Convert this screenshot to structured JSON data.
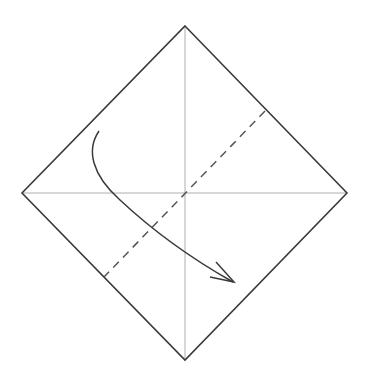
{
  "diagram": {
    "type": "origami-fold-step",
    "colors": {
      "background": "#ffffff",
      "outline": "#3a3a3a",
      "crease": "#9a9a9a",
      "fold_line": "#555555",
      "arrow": "#3a3a3a"
    },
    "paper": {
      "vertices": {
        "top": [
          185,
          26
        ],
        "right": [
          347,
          193
        ],
        "bottom": [
          185,
          360
        ],
        "left": [
          22,
          193
        ]
      }
    },
    "creases": [
      {
        "name": "vertical",
        "from": [
          185,
          26
        ],
        "to": [
          185,
          360
        ]
      },
      {
        "name": "horizontal",
        "from": [
          22,
          193
        ],
        "to": [
          347,
          193
        ]
      }
    ],
    "fold_line": {
      "style": "dashed",
      "from": [
        265,
        111
      ],
      "to": [
        104,
        277
      ]
    },
    "arrow": {
      "path": "M99,131 C86,150 92,175 120,200 C150,228 185,255 233,282",
      "head": [
        [
          216,
          262
        ],
        [
          234,
          282
        ],
        [
          210,
          277
        ]
      ]
    }
  }
}
